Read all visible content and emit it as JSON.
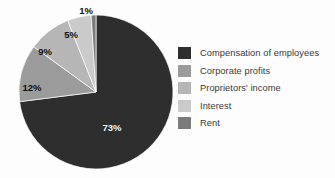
{
  "chart_data": {
    "type": "pie",
    "title": "",
    "subtitle": "",
    "xlabel": "",
    "ylabel": "",
    "grid": false,
    "legend_position": "right",
    "start_angle_deg": 0,
    "direction": "clockwise",
    "categories": [
      "Compensation of employees",
      "Corporate profits",
      "Proprietors' income",
      "Interest",
      "Rent"
    ],
    "values": [
      73,
      12,
      9,
      5,
      1
    ],
    "data_labels": [
      "73%",
      "12%",
      "9%",
      "5%",
      "1%"
    ],
    "colors": [
      "#2e2e2e",
      "#9b9b9b",
      "#b6b6b6",
      "#cacaca",
      "#7b7b7b"
    ],
    "units": "percent"
  },
  "pie": {
    "center_x": 96,
    "center_y": 92,
    "radius": 77,
    "slices": [
      {
        "name": "compensation-of-employees",
        "label": "73%",
        "value": 73,
        "color": "#2e2e2e",
        "label_fill": "light",
        "label_x": 112,
        "label_y": 131
      },
      {
        "name": "corporate-profits",
        "label": "12%",
        "value": 12,
        "color": "#9b9b9b",
        "label_fill": "dark",
        "label_x": 32,
        "label_y": 91
      },
      {
        "name": "proprietors-income",
        "label": "9%",
        "value": 9,
        "color": "#b6b6b6",
        "label_fill": "dark",
        "label_x": 45,
        "label_y": 55
      },
      {
        "name": "interest",
        "label": "5%",
        "value": 5,
        "color": "#cacaca",
        "label_fill": "dark",
        "label_x": 71,
        "label_y": 38
      },
      {
        "name": "rent",
        "label": "1%",
        "value": 1,
        "color": "#7b7b7b",
        "label_fill": "dark",
        "label_x": 86,
        "label_y": 14
      }
    ]
  },
  "legend": {
    "items": [
      {
        "label": "Compensation of employees",
        "color": "#2e2e2e"
      },
      {
        "label": "Corporate profits",
        "color": "#9b9b9b"
      },
      {
        "label": "Proprietors' income",
        "color": "#b6b6b6"
      },
      {
        "label": "Interest",
        "color": "#cacaca"
      },
      {
        "label": "Rent",
        "color": "#7b7b7b"
      }
    ]
  }
}
